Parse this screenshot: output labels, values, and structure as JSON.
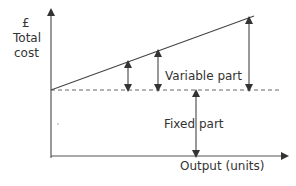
{
  "diagram": {
    "y_axis": {
      "currency": "£",
      "label_line1": "Total",
      "label_line2": "cost"
    },
    "x_axis": {
      "label": "Output (units)"
    },
    "annotations": {
      "variable": "Variable part",
      "fixed": "Fixed part"
    },
    "colors": {
      "line": "#333333",
      "dashed": "#555555",
      "text": "#333333"
    }
  }
}
